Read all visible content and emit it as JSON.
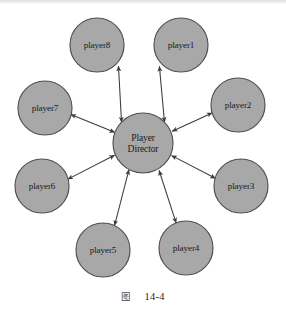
{
  "figure": {
    "type": "star-topology-diagram",
    "caption_cjk": "图",
    "caption_number": "14-4",
    "center_node": {
      "id": "player-director",
      "label_line1": "Player",
      "label_line2": "Director",
      "cx": 143,
      "cy": 143,
      "r": 30
    },
    "peripheral_nodes": [
      {
        "id": "player8",
        "label": "player8",
        "cx": 97,
        "cy": 45,
        "r": 27
      },
      {
        "id": "player1",
        "label": "player1",
        "cx": 181,
        "cy": 45,
        "r": 27
      },
      {
        "id": "player7",
        "label": "player7",
        "cx": 45,
        "cy": 108,
        "r": 27
      },
      {
        "id": "player2",
        "label": "player2",
        "cx": 238,
        "cy": 105,
        "r": 27
      },
      {
        "id": "player6",
        "label": "player6",
        "cx": 42,
        "cy": 186,
        "r": 27
      },
      {
        "id": "player3",
        "label": "player3",
        "cx": 241,
        "cy": 186,
        "r": 27
      },
      {
        "id": "player5",
        "label": "player5",
        "cx": 103,
        "cy": 250,
        "r": 27
      },
      {
        "id": "player4",
        "label": "player4",
        "cx": 186,
        "cy": 248,
        "r": 27
      }
    ],
    "edges": [
      {
        "from": "player-director",
        "to": "player8",
        "style": "double-headed-arrow"
      },
      {
        "from": "player-director",
        "to": "player1",
        "style": "double-headed-arrow"
      },
      {
        "from": "player-director",
        "to": "player7",
        "style": "double-headed-arrow"
      },
      {
        "from": "player-director",
        "to": "player2",
        "style": "double-headed-arrow"
      },
      {
        "from": "player-director",
        "to": "player6",
        "style": "double-headed-arrow"
      },
      {
        "from": "player-director",
        "to": "player3",
        "style": "double-headed-arrow"
      },
      {
        "from": "player-director",
        "to": "player5",
        "style": "double-headed-arrow"
      },
      {
        "from": "player-director",
        "to": "player4",
        "style": "double-headed-arrow"
      }
    ],
    "colors": {
      "node_fill": "#a8a8a8",
      "node_stroke": "#4f4f4f",
      "edge_stroke": "#3c3c3c",
      "label_text": "#1b1b1b",
      "background": "#ffffff"
    }
  }
}
